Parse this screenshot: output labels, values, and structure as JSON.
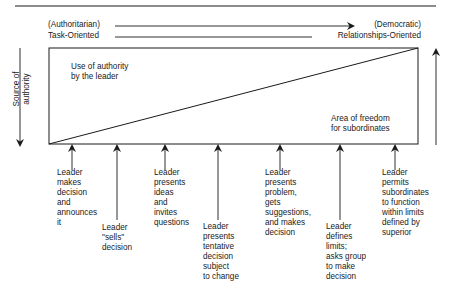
{
  "header": {
    "left_top": "(Authoritarian)",
    "left_bottom": "Task-Oriented",
    "right_top": "(Democratic)",
    "right_bottom": "Relationships-Oriented"
  },
  "axis": {
    "left_label_line1": "Source of",
    "left_label_line2": "authority"
  },
  "regions": {
    "leader_authority_line1": "Use of authority",
    "leader_authority_line2": "by the leader",
    "subordinate_freedom_line1": "Area of freedom",
    "subordinate_freedom_line2": "for subordinates"
  },
  "behaviors": [
    {
      "lines": [
        "Leader",
        "makes",
        "decision",
        "and",
        "announces",
        "it"
      ]
    },
    {
      "lines": [
        "Leader",
        "\"sells\"",
        "decision"
      ]
    },
    {
      "lines": [
        "Leader",
        "presents",
        "ideas",
        "and",
        "invites",
        "questions"
      ]
    },
    {
      "lines": [
        "Leader",
        "presents",
        "tentative",
        "decision",
        "subject",
        "to change"
      ]
    },
    {
      "lines": [
        "Leader",
        "presents",
        "problem,",
        "gets",
        "suggestions,",
        "and makes",
        "decision"
      ]
    },
    {
      "lines": [
        "Leader",
        "defines",
        "limits;",
        "asks group",
        "to make",
        "decision"
      ]
    },
    {
      "lines": [
        "Leader",
        "permits",
        "subordinates",
        "to function",
        "within limits",
        "defined by",
        "superior"
      ]
    }
  ],
  "colors": {
    "line": "#1a1a1a",
    "background": "#ffffff"
  }
}
